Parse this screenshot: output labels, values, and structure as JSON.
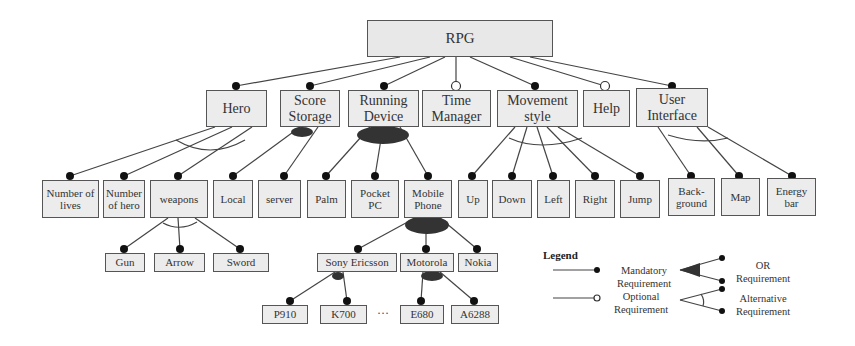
{
  "diagram": {
    "title": "RPG",
    "root": {
      "id": "rpg",
      "label": "RPG"
    },
    "level1": [
      {
        "id": "hero",
        "label": "Hero",
        "relation": "mandatory"
      },
      {
        "id": "score-storage",
        "label": "Score Storage",
        "relation": "mandatory"
      },
      {
        "id": "running-device",
        "label": "Running Device",
        "relation": "mandatory"
      },
      {
        "id": "time-manager",
        "label": "Time Manager",
        "relation": "optional"
      },
      {
        "id": "movement-style",
        "label": "Movement style",
        "relation": "mandatory"
      },
      {
        "id": "help",
        "label": "Help",
        "relation": "optional"
      },
      {
        "id": "user-interface",
        "label": "User Interface",
        "relation": "mandatory"
      }
    ],
    "level2": [
      {
        "id": "number-of-lives",
        "label": "Number of lives",
        "parent": "hero",
        "group": "alternative"
      },
      {
        "id": "number-of-hero",
        "label": "Number of hero",
        "parent": "hero",
        "group": "alternative"
      },
      {
        "id": "weapons",
        "label": "weapons",
        "parent": "hero",
        "group": "alternative"
      },
      {
        "id": "local",
        "label": "Local",
        "parent": "score-storage",
        "group": "or"
      },
      {
        "id": "server",
        "label": "server",
        "parent": "score-storage",
        "group": "or"
      },
      {
        "id": "palm",
        "label": "Palm",
        "parent": "running-device",
        "group": "or"
      },
      {
        "id": "pocket-pc",
        "label": "Pocket PC",
        "parent": "running-device",
        "group": "or"
      },
      {
        "id": "mobile-phone",
        "label": "Mobile Phone",
        "parent": "running-device",
        "group": "or"
      },
      {
        "id": "up",
        "label": "Up",
        "parent": "movement-style",
        "group": "alternative"
      },
      {
        "id": "down",
        "label": "Down",
        "parent": "movement-style",
        "group": "alternative"
      },
      {
        "id": "left",
        "label": "Left",
        "parent": "movement-style",
        "group": "alternative"
      },
      {
        "id": "right",
        "label": "Right",
        "parent": "movement-style",
        "group": "alternative"
      },
      {
        "id": "jump",
        "label": "Jump",
        "parent": "movement-style",
        "group": "alternative"
      },
      {
        "id": "background",
        "label": "Back-ground",
        "parent": "user-interface",
        "group": "alternative"
      },
      {
        "id": "map",
        "label": "Map",
        "parent": "user-interface",
        "group": "alternative"
      },
      {
        "id": "energy-bar",
        "label": "Energy bar",
        "parent": "user-interface",
        "group": "alternative"
      }
    ],
    "level3": [
      {
        "id": "gun",
        "label": "Gun",
        "parent": "weapons",
        "group": "alternative"
      },
      {
        "id": "arrow",
        "label": "Arrow",
        "parent": "weapons",
        "group": "alternative"
      },
      {
        "id": "sword",
        "label": "Sword",
        "parent": "weapons",
        "group": "alternative"
      },
      {
        "id": "sony-ericsson",
        "label": "Sony Ericsson",
        "parent": "mobile-phone",
        "group": "or"
      },
      {
        "id": "motorola",
        "label": "Motorola",
        "parent": "mobile-phone",
        "group": "or"
      },
      {
        "id": "nokia",
        "label": "Nokia",
        "parent": "mobile-phone",
        "group": "or"
      }
    ],
    "level4": [
      {
        "id": "p910",
        "label": "P910",
        "parent": "sony-ericsson",
        "group": "or"
      },
      {
        "id": "k700",
        "label": "K700",
        "parent": "sony-ericsson",
        "group": "or"
      },
      {
        "id": "e680",
        "label": "E680",
        "parent": "motorola",
        "group": "or"
      },
      {
        "id": "a6288",
        "label": "A6288",
        "parent": "motorola",
        "group": "or"
      }
    ],
    "ellipsis": "···"
  },
  "legend": {
    "title": "Legend",
    "mandatory": "Mandatory Requirement",
    "optional": "Optional Requirement",
    "or": "OR Requirement",
    "alternative": "Alternative Requirement"
  },
  "colors": {
    "box_fill": "#ececec",
    "box_border": "#555555",
    "line": "#444444",
    "dot": "#111111",
    "or_fill": "#333333"
  }
}
